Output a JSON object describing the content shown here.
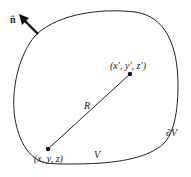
{
  "figure": {
    "normal_label": "n̂",
    "point_prime_label": "(x′, y′, z′)",
    "point_label": "(x, y, z)",
    "distance_label": "R",
    "volume_label": "V",
    "boundary_label": "∂V",
    "colors": {
      "stroke": "#222222",
      "background": "#ffffff"
    }
  }
}
